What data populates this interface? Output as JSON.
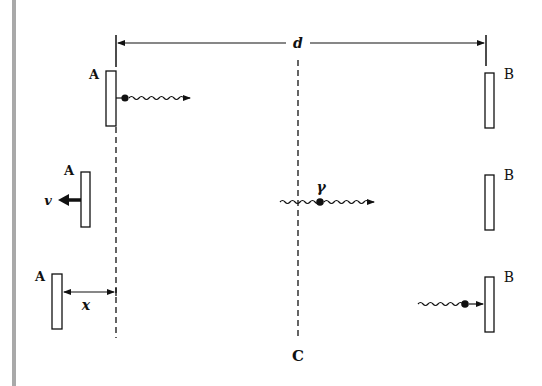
{
  "diagram": {
    "title": "",
    "labels": {
      "distance": "d",
      "mirror_a": "A",
      "mirror_b": "B",
      "velocity": "v",
      "photon": "γ",
      "displacement": "x",
      "center": "C"
    },
    "rows": [
      {
        "id": "row-1",
        "mirror_a_label": "A",
        "mirror_b_label": "B",
        "photon": "emitted at A moving right"
      },
      {
        "id": "row-2",
        "mirror_a_label": "A",
        "mirror_b_label": "B",
        "velocity_label": "v",
        "photon_label": "γ",
        "photon": "at center moving right"
      },
      {
        "id": "row-3",
        "mirror_a_label": "A",
        "mirror_b_label": "B",
        "displacement_label": "x",
        "photon": "arriving at B"
      }
    ],
    "colors": {
      "ink": "#111111",
      "sidebar": "#a9a9a9",
      "background": "#ffffff"
    }
  }
}
